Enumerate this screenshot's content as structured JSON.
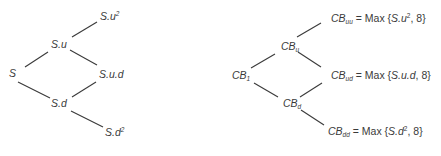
{
  "stock_tree": {
    "nodes": {
      "root": "S",
      "up": "S.u",
      "down": "S.d",
      "up_up_base": "S.u",
      "up_up_exp": "2",
      "up_down": "S.u.d",
      "down_down_base": "S.d",
      "down_down_exp": "2"
    }
  },
  "cb_tree": {
    "prefix": "CB",
    "nodes": {
      "root_sub": "1",
      "up_sub": "u",
      "down_sub": "d",
      "uu_sub": "uu",
      "ud_sub": "ud",
      "dd_sub": "dd"
    },
    "formula": {
      "equals_max": " = Max {",
      "uu_arg": "S.u",
      "uu_exp": "2",
      "ud_arg": "S.u.d",
      "dd_arg": "S.d",
      "dd_exp": "2",
      "strike": ", 8}"
    }
  }
}
